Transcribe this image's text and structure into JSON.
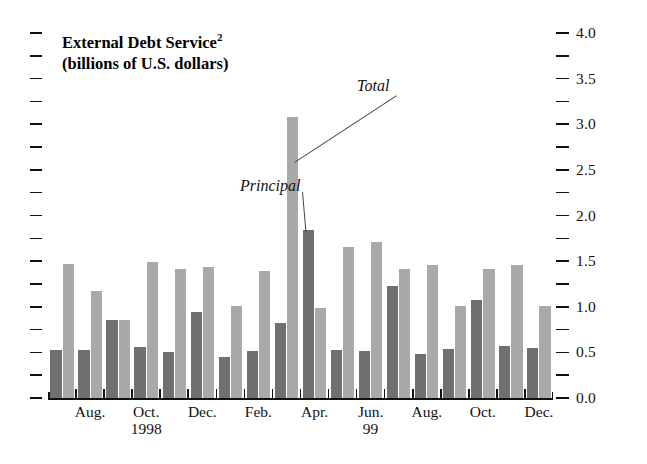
{
  "chart_data": {
    "type": "bar",
    "title": "External Debt Service",
    "title_superscript": "2",
    "subtitle": "(billions of U.S. dollars)",
    "xlabel": "",
    "ylabel": "",
    "ylim": [
      0.0,
      4.0
    ],
    "y_major_step": 0.5,
    "y_minor_step": 0.25,
    "grid": false,
    "legend_position": "annotations-inline",
    "y_tick_labels": [
      "0.0",
      "0.5",
      "1.0",
      "1.5",
      "2.0",
      "2.5",
      "3.0",
      "3.5",
      "4.0"
    ],
    "y_tick_values": [
      0.0,
      0.5,
      1.0,
      1.5,
      2.0,
      2.5,
      3.0,
      3.5,
      4.0
    ],
    "axis_label_side": "right",
    "categories": [
      "Jul. 1998",
      "Aug. 1998",
      "Sep. 1998",
      "Oct. 1998",
      "Nov. 1998",
      "Dec. 1998",
      "Jan. 1999",
      "Feb. 1999",
      "Mar. 1999",
      "Apr. 1999",
      "May 1999",
      "Jun. 1999",
      "Jul. 1999",
      "Aug. 1999",
      "Sep. 1999",
      "Oct. 1999",
      "Nov. 1999",
      "Dec. 1999"
    ],
    "series": [
      {
        "name": "Principal",
        "color": "#707070",
        "values": [
          0.53,
          0.53,
          0.86,
          0.56,
          0.5,
          0.94,
          0.45,
          0.52,
          0.82,
          1.84,
          0.53,
          0.52,
          1.23,
          0.48,
          0.54,
          1.07,
          0.57,
          0.55
        ]
      },
      {
        "name": "Total",
        "color": "#a9a9a9",
        "values": [
          1.47,
          1.17,
          0.86,
          1.49,
          1.41,
          1.44,
          1.01,
          1.39,
          3.08,
          0.99,
          1.66,
          1.71,
          1.41,
          1.46,
          1.01,
          1.41,
          1.46,
          1.01
        ]
      }
    ],
    "annotations": [
      {
        "label": "Total",
        "points_to": "tallest-light-bar"
      },
      {
        "label": "Principal",
        "points_to": "tallest-dark-bar"
      }
    ],
    "x_tick_labels": [
      {
        "label": "Aug.",
        "year": ""
      },
      {
        "label": "Oct.",
        "year": "1998"
      },
      {
        "label": "Dec.",
        "year": ""
      },
      {
        "label": "Feb.",
        "year": ""
      },
      {
        "label": "Apr.",
        "year": ""
      },
      {
        "label": "Jun.",
        "year": "99"
      },
      {
        "label": "Aug.",
        "year": ""
      },
      {
        "label": "Oct.",
        "year": ""
      },
      {
        "label": "Dec.",
        "year": ""
      }
    ]
  }
}
